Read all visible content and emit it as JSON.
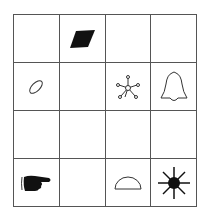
{
  "grid": {
    "rows": 4,
    "cols": 4,
    "line_color": "#555555",
    "cells": [
      {
        "row": 0,
        "col": 0,
        "symbol": ""
      },
      {
        "row": 0,
        "col": 1,
        "symbol": "filled-parallelogram"
      },
      {
        "row": 0,
        "col": 2,
        "symbol": ""
      },
      {
        "row": 0,
        "col": 3,
        "symbol": ""
      },
      {
        "row": 1,
        "col": 0,
        "symbol": "tilted-ellipse"
      },
      {
        "row": 1,
        "col": 1,
        "symbol": ""
      },
      {
        "row": 1,
        "col": 2,
        "symbol": "hub-network"
      },
      {
        "row": 1,
        "col": 3,
        "symbol": "bell-outline"
      },
      {
        "row": 2,
        "col": 0,
        "symbol": ""
      },
      {
        "row": 2,
        "col": 1,
        "symbol": ""
      },
      {
        "row": 2,
        "col": 2,
        "symbol": ""
      },
      {
        "row": 2,
        "col": 3,
        "symbol": ""
      },
      {
        "row": 3,
        "col": 0,
        "symbol": "pointing-hand"
      },
      {
        "row": 3,
        "col": 1,
        "symbol": ""
      },
      {
        "row": 3,
        "col": 2,
        "symbol": "semicircle-outline"
      },
      {
        "row": 3,
        "col": 3,
        "symbol": "starburst-sun"
      }
    ]
  }
}
